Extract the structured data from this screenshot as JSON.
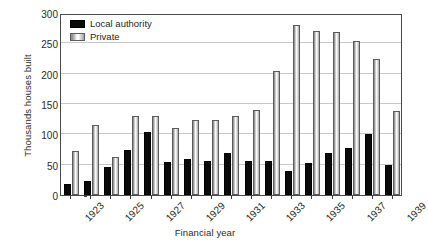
{
  "chart_data": {
    "type": "bar",
    "title": "",
    "xlabel": "Financial year",
    "ylabel": "Thousands houses built",
    "ylim": [
      0,
      300
    ],
    "yticks": [
      0,
      50,
      100,
      150,
      200,
      250,
      300
    ],
    "grid": true,
    "legend_position": "top-left",
    "categories": [
      "1923",
      "1924",
      "1925",
      "1926",
      "1927",
      "1928",
      "1929",
      "1930",
      "1931",
      "1932",
      "1933",
      "1934",
      "1935",
      "1936",
      "1937",
      "1938",
      "1939"
    ],
    "tick_labels": [
      "1923",
      "1925",
      "1927",
      "1929",
      "1931",
      "1933",
      "1935",
      "1937",
      "1939"
    ],
    "series": [
      {
        "name": "Local authority",
        "color": "#0a0a0a",
        "values": [
          18,
          23,
          46,
          74,
          104,
          55,
          60,
          56,
          70,
          56,
          56,
          40,
          52,
          70,
          77,
          101,
          50
        ]
      },
      {
        "name": "Private",
        "color": "#d9d9d9",
        "values": [
          72,
          116,
          62,
          130,
          131,
          111,
          123,
          124,
          131,
          140,
          205,
          281,
          270,
          269,
          254,
          225,
          138
        ]
      }
    ]
  },
  "legend": {
    "items": [
      {
        "label": "Local authority",
        "swatch": "black-swatch"
      },
      {
        "label": "Private",
        "swatch": "gray-swatch"
      }
    ]
  },
  "axes": {
    "y_title": "Thousands houses built",
    "x_title": "Financial year"
  }
}
